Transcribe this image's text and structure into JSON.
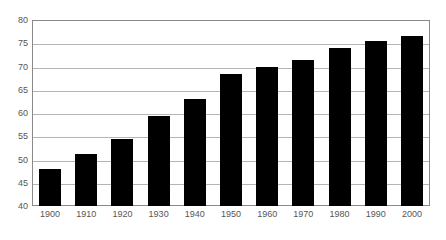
{
  "chart_data": {
    "type": "bar",
    "title": "",
    "subtitle": "",
    "xlabel": "",
    "ylabel": "",
    "categories": [
      "1900",
      "1910",
      "1920",
      "1930",
      "1940",
      "1950",
      "1960",
      "1970",
      "1980",
      "1990",
      "2000"
    ],
    "values": [
      48.0,
      51.2,
      54.5,
      59.4,
      63.0,
      68.3,
      70.0,
      71.3,
      73.9,
      75.5,
      76.6
    ],
    "ylim": [
      40,
      80
    ],
    "yticks": [
      40,
      45,
      50,
      55,
      60,
      65,
      70,
      75,
      80
    ],
    "ytick_labels": [
      "40",
      "45",
      "50",
      "55",
      "60",
      "65",
      "70",
      "75",
      "80"
    ],
    "grid": true,
    "grid_axis": "y",
    "legend": false,
    "legend_position": "none",
    "series": [
      {
        "name": "",
        "values": [
          48.0,
          51.2,
          54.5,
          59.4,
          63.0,
          68.3,
          70.0,
          71.3,
          73.9,
          75.5,
          76.6
        ]
      }
    ],
    "colors": {
      "bar": "#000000",
      "grid": "#b4b4b4",
      "frame": "#8a8a8a",
      "tick_label": "#555555",
      "background": "#ffffff"
    }
  }
}
